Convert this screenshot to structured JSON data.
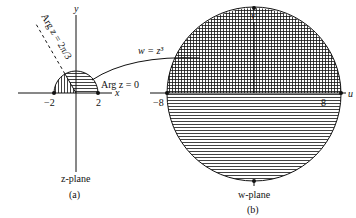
{
  "figure": {
    "panel_a": {
      "caption": "(a)",
      "plane_label": "z-plane",
      "axis_x": "x",
      "axis_y": "y",
      "tick_neg": "−2",
      "tick_pos": "2",
      "ray_label_1": "Arg z = 0",
      "ray_label_2": "Arg z = 2π/3"
    },
    "panel_b": {
      "caption": "(b)",
      "plane_label": "w-plane",
      "axis_u": "u",
      "axis_v": "v",
      "tick_neg": "−8",
      "tick_pos": "8"
    },
    "mapping_label": "w = z³",
    "colors": {
      "ink": "#111111",
      "background": "#ffffff"
    }
  }
}
